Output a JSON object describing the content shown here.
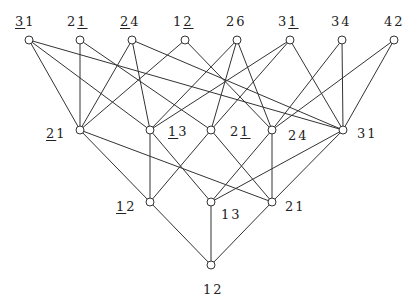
{
  "diagram": {
    "type": "Hasse diagram / lattice",
    "nodes": [
      {
        "id": "t1",
        "x": 29,
        "y": 40,
        "label": {
          "parts": [
            {
              "t": "3",
              "u": true
            },
            {
              "t": "1",
              "u": false
            }
          ],
          "lx": 15,
          "ly": 14
        }
      },
      {
        "id": "t2",
        "x": 80,
        "y": 40,
        "label": {
          "parts": [
            {
              "t": "2",
              "u": false
            },
            {
              "t": "1",
              "u": true
            }
          ],
          "lx": 67,
          "ly": 14
        }
      },
      {
        "id": "t3",
        "x": 132,
        "y": 40,
        "label": {
          "parts": [
            {
              "t": "2",
              "u": true
            },
            {
              "t": "4",
              "u": false
            }
          ],
          "lx": 120,
          "ly": 14
        }
      },
      {
        "id": "t4",
        "x": 185,
        "y": 40,
        "label": {
          "parts": [
            {
              "t": "1",
              "u": false
            },
            {
              "t": "2",
              "u": true
            }
          ],
          "lx": 173,
          "ly": 14
        }
      },
      {
        "id": "t5",
        "x": 237,
        "y": 40,
        "label": {
          "parts": [
            {
              "t": "26",
              "u": false
            }
          ],
          "lx": 226,
          "ly": 14
        }
      },
      {
        "id": "t6",
        "x": 290,
        "y": 40,
        "label": {
          "parts": [
            {
              "t": "3",
              "u": false
            },
            {
              "t": "1",
              "u": true
            }
          ],
          "lx": 278,
          "ly": 14
        }
      },
      {
        "id": "t7",
        "x": 342,
        "y": 40,
        "label": {
          "parts": [
            {
              "t": "34",
              "u": false
            }
          ],
          "lx": 331,
          "ly": 14
        }
      },
      {
        "id": "t8",
        "x": 394,
        "y": 40,
        "label": {
          "parts": [
            {
              "t": "42",
              "u": false
            }
          ],
          "lx": 384,
          "ly": 14
        }
      },
      {
        "id": "m1",
        "x": 80,
        "y": 130,
        "label": {
          "parts": [
            {
              "t": "2",
              "u": true
            },
            {
              "t": "1",
              "u": false
            }
          ],
          "lx": 46,
          "ly": 126
        }
      },
      {
        "id": "m2",
        "x": 150,
        "y": 130,
        "label": {
          "parts": [
            {
              "t": "1",
              "u": true
            },
            {
              "t": "3",
              "u": false
            }
          ],
          "lx": 168,
          "ly": 124
        }
      },
      {
        "id": "m3",
        "x": 211,
        "y": 130,
        "label": {
          "parts": [
            {
              "t": "2",
              "u": false
            },
            {
              "t": "1",
              "u": true
            }
          ],
          "lx": 230,
          "ly": 124
        }
      },
      {
        "id": "m4",
        "x": 272,
        "y": 130,
        "label": {
          "parts": [
            {
              "t": "24",
              "u": false
            }
          ],
          "lx": 288,
          "ly": 128
        }
      },
      {
        "id": "m5",
        "x": 343,
        "y": 130,
        "label": {
          "parts": [
            {
              "t": "31",
              "u": false
            }
          ],
          "lx": 357,
          "ly": 126
        }
      },
      {
        "id": "b1",
        "x": 150,
        "y": 202,
        "label": {
          "parts": [
            {
              "t": "1",
              "u": true
            },
            {
              "t": "2",
              "u": false
            }
          ],
          "lx": 116,
          "ly": 199
        }
      },
      {
        "id": "b2",
        "x": 211,
        "y": 202,
        "label": {
          "parts": [
            {
              "t": "13",
              "u": false
            }
          ],
          "lx": 221,
          "ly": 207
        }
      },
      {
        "id": "b3",
        "x": 272,
        "y": 202,
        "label": {
          "parts": [
            {
              "t": "21",
              "u": false
            }
          ],
          "lx": 285,
          "ly": 199
        }
      },
      {
        "id": "r",
        "x": 211,
        "y": 265,
        "label": {
          "parts": [
            {
              "t": "12",
              "u": false
            }
          ],
          "lx": 203,
          "ly": 282
        }
      }
    ],
    "edges": [
      [
        "t1",
        "m1"
      ],
      [
        "t1",
        "m2"
      ],
      [
        "t1",
        "m5"
      ],
      [
        "t2",
        "m1"
      ],
      [
        "t2",
        "m3"
      ],
      [
        "t3",
        "m1"
      ],
      [
        "t3",
        "m2"
      ],
      [
        "t3",
        "m5"
      ],
      [
        "t4",
        "m1"
      ],
      [
        "t4",
        "m4"
      ],
      [
        "t5",
        "m2"
      ],
      [
        "t5",
        "m3"
      ],
      [
        "t5",
        "m4"
      ],
      [
        "t6",
        "m2"
      ],
      [
        "t6",
        "m3"
      ],
      [
        "t6",
        "m5"
      ],
      [
        "t7",
        "m4"
      ],
      [
        "t7",
        "m5"
      ],
      [
        "t8",
        "m4"
      ],
      [
        "t8",
        "m5"
      ],
      [
        "m1",
        "b1"
      ],
      [
        "m1",
        "b3"
      ],
      [
        "m2",
        "b1"
      ],
      [
        "m2",
        "b2"
      ],
      [
        "m3",
        "b1"
      ],
      [
        "m3",
        "b3"
      ],
      [
        "m4",
        "b2"
      ],
      [
        "m4",
        "b3"
      ],
      [
        "m5",
        "b2"
      ],
      [
        "m5",
        "b3"
      ],
      [
        "b1",
        "r"
      ],
      [
        "b2",
        "r"
      ],
      [
        "b3",
        "r"
      ]
    ],
    "style": {
      "line_color": "#333333",
      "node_fill": "#ffffff",
      "node_stroke": "#333333",
      "node_radius": 4
    }
  }
}
